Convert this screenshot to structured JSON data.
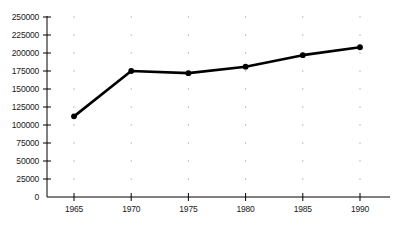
{
  "chart_data": {
    "type": "line",
    "title": "",
    "xlabel": "",
    "ylabel": "",
    "x": [
      1965,
      1970,
      1975,
      1980,
      1985,
      1990
    ],
    "categories": [
      "1965",
      "1970",
      "1975",
      "1980",
      "1985",
      "1990"
    ],
    "values": [
      112000,
      175000,
      172000,
      181000,
      197000,
      208000
    ],
    "series": [
      {
        "name": "",
        "values": [
          112000,
          175000,
          172000,
          181000,
          197000,
          208000
        ]
      }
    ],
    "xlim": [
      1962.5,
      1992.5
    ],
    "ylim": [
      0,
      250000
    ],
    "y_ticks": [
      0,
      25000,
      50000,
      75000,
      100000,
      125000,
      150000,
      175000,
      200000,
      225000,
      250000
    ],
    "y_tick_labels": [
      "0",
      "25000",
      "50000",
      "75000",
      "100000",
      "125000",
      "150000",
      "175000",
      "200000",
      "225000",
      "250000"
    ],
    "x_ticks": [
      1965,
      1970,
      1975,
      1980,
      1985,
      1990
    ],
    "x_tick_labels": [
      "1965",
      "1970",
      "1975",
      "1980",
      "1985",
      "1990"
    ],
    "grid": "dotted-points-at-intersections",
    "legend": "none",
    "legend_position": "",
    "colors": {
      "line": "#000000",
      "marker": "#000000",
      "axis": "#000000",
      "grid": "#9a9a9a",
      "text": "#1a1a1a",
      "background": "#ffffff"
    },
    "line_width": 2.6,
    "marker_size": 5,
    "marker_shape": "circle"
  }
}
